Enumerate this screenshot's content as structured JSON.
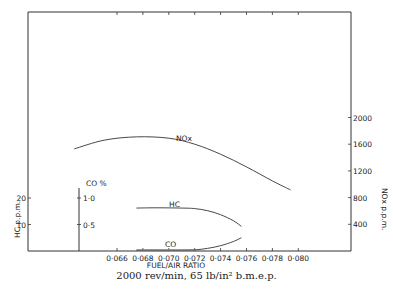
{
  "chart_data": {
    "type": "line",
    "title": "",
    "caption": "2000 rev/min, 65 lb/in² b.m.e.p.",
    "xlabel": "FUEL/AIR   RATIO",
    "x_ticks": [
      "0·066",
      "0·068",
      "0·070",
      "0·072",
      "0·074",
      "0·076",
      "0·078",
      "0·080"
    ],
    "xlim": [
      0.0592,
      0.0819
    ],
    "axes": {
      "hc": {
        "label": "HC p.p.m.",
        "ticks": [
          "10",
          "20"
        ],
        "range": [
          0,
          25
        ]
      },
      "co": {
        "label": "CO %",
        "ticks": [
          "0·5",
          "1·0"
        ],
        "range": [
          0,
          1.25
        ]
      },
      "nox": {
        "label": "NOx p.p.m.",
        "ticks": [
          "400",
          "800",
          "1200",
          "1600",
          "2000"
        ],
        "range": [
          0,
          3600
        ]
      }
    },
    "grid": false,
    "series": [
      {
        "name": "NOx",
        "axis": "nox",
        "x": [
          0.0627,
          0.065,
          0.0675,
          0.07,
          0.072,
          0.074,
          0.076,
          0.078,
          0.0794
        ],
        "y": [
          1530,
          1660,
          1710,
          1690,
          1600,
          1450,
          1260,
          1050,
          915
        ]
      },
      {
        "name": "HC",
        "axis": "hc",
        "x": [
          0.0675,
          0.069,
          0.071,
          0.072,
          0.073,
          0.074,
          0.075,
          0.0756
        ],
        "y": [
          16.2,
          16.3,
          16.2,
          16.0,
          15.2,
          13.7,
          11.4,
          9.3
        ]
      },
      {
        "name": "CO",
        "axis": "co",
        "x": [
          0.0675,
          0.069,
          0.071,
          0.072,
          0.073,
          0.074,
          0.075,
          0.0756
        ],
        "y": [
          0.01,
          0.01,
          0.01,
          0.02,
          0.05,
          0.1,
          0.18,
          0.25
        ]
      }
    ]
  },
  "labels": {
    "nox_series": "NOx",
    "hc_series": "HC",
    "co_series": "CO",
    "co_axis_title": "CO %",
    "hc_axis_title": "HC p.p.m.",
    "nox_axis_title": "NOx p.p.m.",
    "x_axis_title": "FUEL/AIR   RATIO",
    "caption": "2000 rev/min, 65 lb/in² b.m.e.p."
  }
}
